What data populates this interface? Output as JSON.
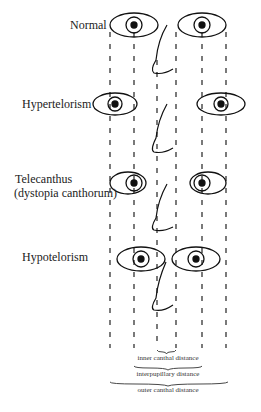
{
  "rows": [
    {
      "label": "Normal"
    },
    {
      "label": "Hypertelorism"
    },
    {
      "label_line1": "Telecanthus",
      "label_line2": "(dystopia canthorum)"
    },
    {
      "label": "Hypotelorism"
    }
  ],
  "measurements": {
    "inner": "inner canthal distance",
    "interpupillary": "interpupillary distance",
    "outer": "outer canthal distance"
  }
}
